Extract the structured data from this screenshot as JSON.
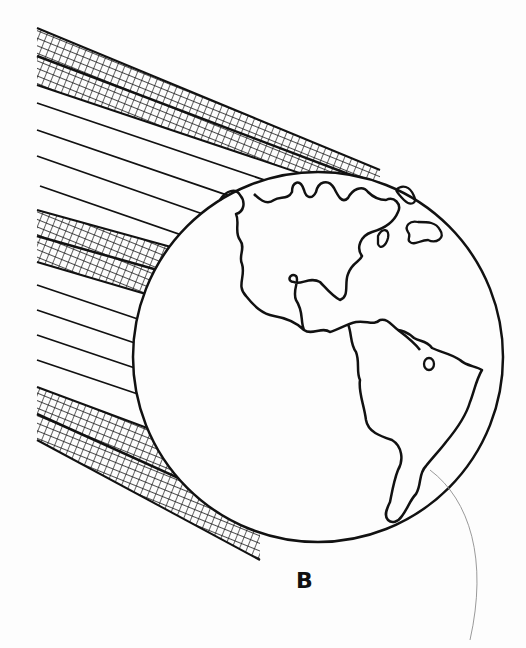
{
  "figure": {
    "label": "B",
    "globe": {
      "cx": 318,
      "cy": 357,
      "r": 185,
      "continents": [
        "North America",
        "South America"
      ]
    },
    "ray_bands": [
      {
        "type": "crosshatch",
        "position": "top"
      },
      {
        "type": "lines",
        "count": 5,
        "position": "upper-middle"
      },
      {
        "type": "crosshatch",
        "position": "middle"
      },
      {
        "type": "lines",
        "count": 5,
        "position": "lower-middle"
      },
      {
        "type": "crosshatch",
        "position": "bottom"
      }
    ],
    "colors": {
      "ink": "#111111",
      "paper": "#fdfdfd",
      "faint_curve": "#9a9a9a"
    }
  }
}
